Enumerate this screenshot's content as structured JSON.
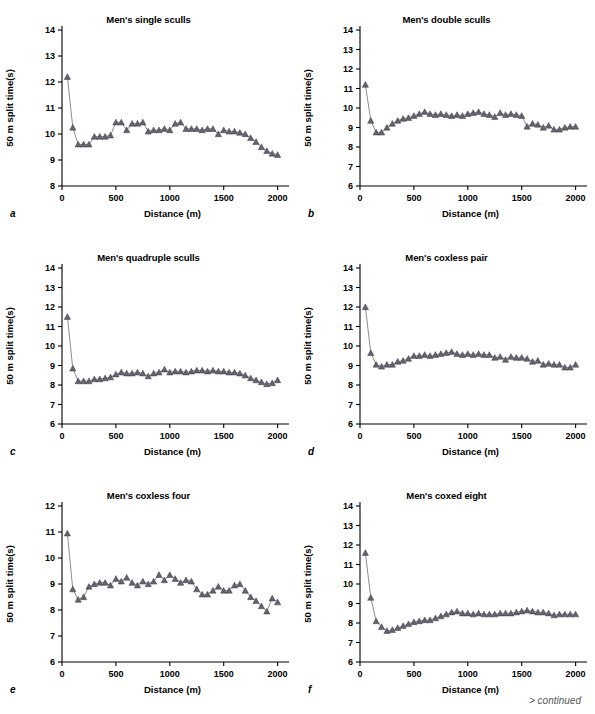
{
  "figure": {
    "footer_note": "> continued",
    "panel_letters": [
      "a",
      "b",
      "c",
      "d",
      "e",
      "f"
    ]
  },
  "axis_common": {
    "xlabel": "Distance (m)",
    "ylabel": "50 m split time(s)",
    "xticks": [
      0,
      500,
      1000,
      1500,
      2000
    ],
    "xlim": [
      0,
      2050
    ]
  },
  "chart_data": [
    {
      "id": "a",
      "type": "line",
      "title": "Men's single sculls",
      "xlabel": "Distance (m)",
      "ylabel": "50 m split time(s)",
      "xlim": [
        0,
        2050
      ],
      "ylim": [
        8,
        14
      ],
      "yticks": [
        8,
        9,
        10,
        11,
        12,
        13,
        14
      ],
      "xticks": [
        0,
        500,
        1000,
        1500,
        2000
      ],
      "grid": false,
      "legend": "none",
      "marker": "triangle",
      "x": [
        50,
        100,
        150,
        200,
        250,
        300,
        350,
        400,
        450,
        500,
        550,
        600,
        650,
        700,
        750,
        800,
        850,
        900,
        950,
        1000,
        1050,
        1100,
        1150,
        1200,
        1250,
        1300,
        1350,
        1400,
        1450,
        1500,
        1550,
        1600,
        1650,
        1700,
        1750,
        1800,
        1850,
        1900,
        1950,
        2000
      ],
      "y": [
        12.2,
        10.25,
        9.6,
        9.6,
        9.6,
        9.9,
        9.9,
        9.9,
        9.95,
        10.45,
        10.45,
        10.15,
        10.4,
        10.4,
        10.45,
        10.1,
        10.15,
        10.15,
        10.2,
        10.15,
        10.4,
        10.45,
        10.2,
        10.2,
        10.2,
        10.15,
        10.2,
        10.2,
        10.0,
        10.15,
        10.1,
        10.1,
        10.05,
        10.0,
        9.85,
        9.7,
        9.5,
        9.35,
        9.25,
        9.2
      ]
    },
    {
      "id": "b",
      "type": "line",
      "title": "Men's double sculls",
      "xlabel": "Distance (m)",
      "ylabel": "50 m split time(s)",
      "xlim": [
        0,
        2050
      ],
      "ylim": [
        6,
        14
      ],
      "yticks": [
        6,
        7,
        8,
        9,
        10,
        11,
        12,
        13,
        14
      ],
      "xticks": [
        0,
        500,
        1000,
        1500,
        2000
      ],
      "grid": false,
      "legend": "none",
      "marker": "triangle",
      "x": [
        50,
        100,
        150,
        200,
        250,
        300,
        350,
        400,
        450,
        500,
        550,
        600,
        650,
        700,
        750,
        800,
        850,
        900,
        950,
        1000,
        1050,
        1100,
        1150,
        1200,
        1250,
        1300,
        1350,
        1400,
        1450,
        1500,
        1550,
        1600,
        1650,
        1700,
        1750,
        1800,
        1850,
        1900,
        1950,
        2000
      ],
      "y": [
        11.2,
        9.35,
        8.75,
        8.75,
        9.0,
        9.2,
        9.35,
        9.45,
        9.5,
        9.6,
        9.7,
        9.8,
        9.7,
        9.65,
        9.7,
        9.65,
        9.6,
        9.65,
        9.6,
        9.7,
        9.75,
        9.8,
        9.7,
        9.65,
        9.55,
        9.75,
        9.65,
        9.7,
        9.65,
        9.6,
        9.05,
        9.2,
        9.15,
        9.0,
        9.1,
        8.9,
        8.9,
        9.0,
        9.05,
        9.05
      ]
    },
    {
      "id": "c",
      "type": "line",
      "title": "Men's quadruple sculls",
      "xlabel": "Distance (m)",
      "ylabel": "50 m split time(s)",
      "xlim": [
        0,
        2050
      ],
      "ylim": [
        6,
        14
      ],
      "yticks": [
        6,
        7,
        8,
        9,
        10,
        11,
        12,
        13,
        14
      ],
      "xticks": [
        0,
        500,
        1000,
        1500,
        2000
      ],
      "grid": false,
      "legend": "none",
      "marker": "triangle",
      "x": [
        50,
        100,
        150,
        200,
        250,
        300,
        350,
        400,
        450,
        500,
        550,
        600,
        650,
        700,
        750,
        800,
        850,
        900,
        950,
        1000,
        1050,
        1100,
        1150,
        1200,
        1250,
        1300,
        1350,
        1400,
        1450,
        1500,
        1550,
        1600,
        1650,
        1700,
        1750,
        1800,
        1850,
        1900,
        1950,
        2000
      ],
      "y": [
        11.5,
        8.85,
        8.2,
        8.2,
        8.2,
        8.3,
        8.3,
        8.35,
        8.4,
        8.55,
        8.65,
        8.6,
        8.6,
        8.65,
        8.6,
        8.45,
        8.6,
        8.65,
        8.8,
        8.65,
        8.7,
        8.7,
        8.65,
        8.7,
        8.75,
        8.75,
        8.7,
        8.75,
        8.7,
        8.7,
        8.65,
        8.65,
        8.6,
        8.5,
        8.35,
        8.25,
        8.15,
        8.05,
        8.1,
        8.25
      ]
    },
    {
      "id": "d",
      "type": "line",
      "title": "Men's coxless pair",
      "xlabel": "Distance (m)",
      "ylabel": "50 m split time(s)",
      "xlim": [
        0,
        2050
      ],
      "ylim": [
        6,
        14
      ],
      "yticks": [
        6,
        7,
        8,
        9,
        10,
        11,
        12,
        13,
        14
      ],
      "xticks": [
        0,
        500,
        1000,
        1500,
        2000
      ],
      "grid": false,
      "legend": "none",
      "marker": "triangle",
      "x": [
        50,
        100,
        150,
        200,
        250,
        300,
        350,
        400,
        450,
        500,
        550,
        600,
        650,
        700,
        750,
        800,
        850,
        900,
        950,
        1000,
        1050,
        1100,
        1150,
        1200,
        1250,
        1300,
        1350,
        1400,
        1450,
        1500,
        1550,
        1600,
        1650,
        1700,
        1750,
        1800,
        1850,
        1900,
        1950,
        2000
      ],
      "y": [
        12.0,
        9.65,
        9.05,
        8.95,
        9.05,
        9.05,
        9.2,
        9.25,
        9.35,
        9.5,
        9.5,
        9.55,
        9.5,
        9.55,
        9.6,
        9.65,
        9.7,
        9.6,
        9.55,
        9.6,
        9.55,
        9.6,
        9.55,
        9.55,
        9.4,
        9.45,
        9.3,
        9.45,
        9.4,
        9.4,
        9.35,
        9.2,
        9.25,
        9.05,
        9.1,
        9.05,
        9.05,
        8.9,
        8.9,
        9.05
      ]
    },
    {
      "id": "e",
      "type": "line",
      "title": "Men's coxless four",
      "xlabel": "Distance (m)",
      "ylabel": "50 m split time(s)",
      "xlim": [
        0,
        2050
      ],
      "ylim": [
        6,
        12
      ],
      "yticks": [
        6,
        7,
        8,
        9,
        10,
        11,
        12
      ],
      "xticks": [
        0,
        500,
        1000,
        1500,
        2000
      ],
      "grid": false,
      "legend": "none",
      "marker": "triangle",
      "x": [
        50,
        100,
        150,
        200,
        250,
        300,
        350,
        400,
        450,
        500,
        550,
        600,
        650,
        700,
        750,
        800,
        850,
        900,
        950,
        1000,
        1050,
        1100,
        1150,
        1200,
        1250,
        1300,
        1350,
        1400,
        1450,
        1500,
        1550,
        1600,
        1650,
        1700,
        1750,
        1800,
        1850,
        1900,
        1950,
        2000
      ],
      "y": [
        10.95,
        8.8,
        8.4,
        8.5,
        8.9,
        9.0,
        9.05,
        9.05,
        8.95,
        9.2,
        9.1,
        9.25,
        9.05,
        8.95,
        9.1,
        9.0,
        9.1,
        9.35,
        9.15,
        9.35,
        9.2,
        9.05,
        9.15,
        9.1,
        8.8,
        8.6,
        8.6,
        8.75,
        8.9,
        8.75,
        8.75,
        8.95,
        9.0,
        8.75,
        8.5,
        8.35,
        8.15,
        7.95,
        8.45,
        8.3
      ]
    },
    {
      "id": "f",
      "type": "line",
      "title": "Men's coxed eight",
      "xlabel": "Distance (m)",
      "ylabel": "50 m split time(s)",
      "xlim": [
        0,
        2050
      ],
      "ylim": [
        6,
        14
      ],
      "yticks": [
        6,
        7,
        8,
        9,
        10,
        11,
        12,
        13,
        14
      ],
      "xticks": [
        0,
        500,
        1000,
        1500,
        2000
      ],
      "grid": false,
      "legend": "none",
      "marker": "triangle",
      "x": [
        50,
        100,
        150,
        200,
        250,
        300,
        350,
        400,
        450,
        500,
        550,
        600,
        650,
        700,
        750,
        800,
        850,
        900,
        950,
        1000,
        1050,
        1100,
        1150,
        1200,
        1250,
        1300,
        1350,
        1400,
        1450,
        1500,
        1550,
        1600,
        1650,
        1700,
        1750,
        1800,
        1850,
        1900,
        1950,
        2000
      ],
      "y": [
        11.6,
        9.3,
        8.1,
        7.8,
        7.6,
        7.65,
        7.75,
        7.85,
        7.95,
        8.05,
        8.1,
        8.15,
        8.15,
        8.25,
        8.35,
        8.45,
        8.55,
        8.6,
        8.5,
        8.5,
        8.45,
        8.5,
        8.45,
        8.45,
        8.45,
        8.5,
        8.5,
        8.5,
        8.55,
        8.6,
        8.65,
        8.6,
        8.55,
        8.55,
        8.5,
        8.4,
        8.45,
        8.45,
        8.45,
        8.45
      ]
    }
  ]
}
